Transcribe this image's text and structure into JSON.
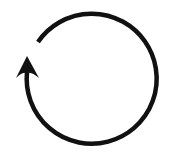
{
  "icon": {
    "name": "refresh-arrow-icon",
    "description": "Circular arrow, counter-clockwise gap with arrowhead pointing up on left side",
    "stroke_color": "#111111",
    "background_color": "#ffffff"
  }
}
